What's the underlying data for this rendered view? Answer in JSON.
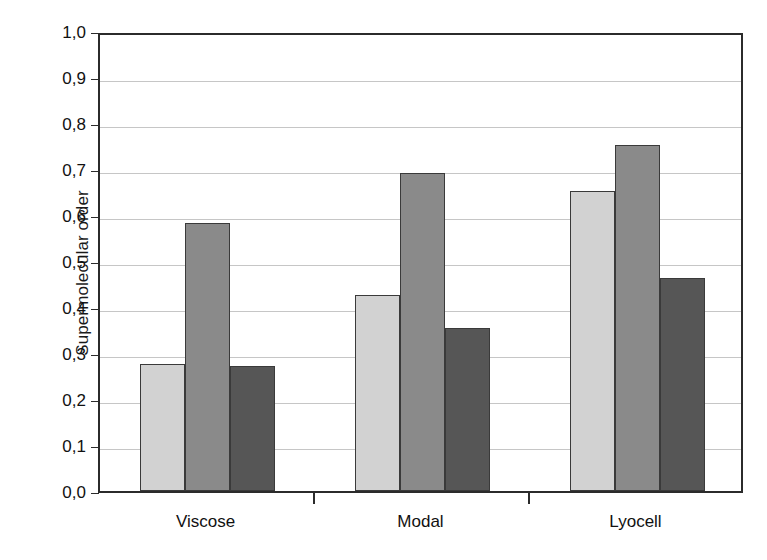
{
  "chart_data": {
    "type": "bar",
    "title": "",
    "subtitle": "",
    "xlabel": "",
    "ylabel": "Supermolecular order",
    "categories": [
      "Viscose",
      "Modal",
      "Lyocell"
    ],
    "series": [
      {
        "name": "series-1",
        "color": "#d2d2d2",
        "values": [
          0.276,
          0.427,
          0.652
        ]
      },
      {
        "name": "series-2",
        "color": "#8a8a8a",
        "values": [
          0.583,
          0.691,
          0.752
        ]
      },
      {
        "name": "series-3",
        "color": "#565656",
        "values": [
          0.272,
          0.354,
          0.463
        ]
      }
    ],
    "ylim": [
      0.0,
      1.0
    ],
    "y_ticks": [
      "0,0",
      "0,1",
      "0,2",
      "0,3",
      "0,4",
      "0,5",
      "0,6",
      "0,7",
      "0,8",
      "0,9",
      "1,0"
    ],
    "y_tick_values": [
      0.0,
      0.1,
      0.2,
      0.3,
      0.4,
      0.5,
      0.6,
      0.7,
      0.8,
      0.9,
      1.0
    ],
    "grid": true,
    "grid_axis": "y",
    "legend": "none",
    "legend_position": "none",
    "decimal_separator": ",",
    "axis_color": "#2b2b2b",
    "grid_color": "#c6c6c6",
    "bar_edge_color": "#3a3a3a",
    "background_color": "#ffffff"
  }
}
